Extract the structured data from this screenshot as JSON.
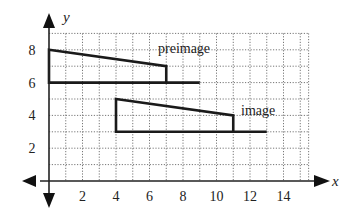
{
  "chart_data": {
    "type": "diagram",
    "title": "",
    "xlabel": "x",
    "ylabel": "y",
    "xlim": [
      0,
      15.5
    ],
    "ylim": [
      0,
      9
    ],
    "grid": true,
    "grid_style": "dotted",
    "x_ticks": [
      2,
      4,
      6,
      8,
      10,
      12,
      14
    ],
    "y_ticks": [
      2,
      4,
      6,
      8
    ],
    "shapes": [
      {
        "name": "preimage",
        "label": "preimage",
        "vertices": [
          [
            0,
            8
          ],
          [
            7,
            7
          ],
          [
            7,
            6
          ],
          [
            0,
            6
          ]
        ],
        "extra_segment": [
          [
            7,
            6
          ],
          [
            9,
            6
          ]
        ]
      },
      {
        "name": "image",
        "label": "image",
        "vertices": [
          [
            4,
            5
          ],
          [
            11,
            4
          ],
          [
            11,
            3
          ],
          [
            4,
            3
          ]
        ],
        "extra_segment": [
          [
            11,
            3
          ],
          [
            13,
            3
          ]
        ]
      }
    ]
  },
  "labels": {
    "x_axis": "x",
    "y_axis": "y",
    "preimage": "preimage",
    "image": "image",
    "x_ticks": [
      "2",
      "4",
      "6",
      "8",
      "10",
      "12",
      "14"
    ],
    "y_ticks": [
      "2",
      "4",
      "6",
      "8"
    ]
  }
}
